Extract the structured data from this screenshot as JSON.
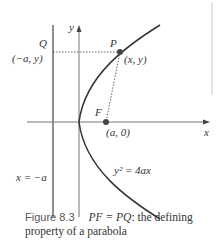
{
  "diagram": {
    "type": "parabola-focus-directrix",
    "labels": {
      "y_axis": "y",
      "x_axis": "x",
      "point_Q": "Q",
      "point_Q_coords": "(−a, y)",
      "point_P": "P",
      "point_P_coords": "(x, y)",
      "point_F": "F",
      "point_F_coords": "(a, 0)",
      "directrix": "x = −a",
      "equation": "y² = 4ax"
    },
    "colors": {
      "curve": "#333333",
      "axes": "#555555",
      "dotted": "#555555",
      "point": "#444444",
      "text": "#333333"
    }
  },
  "caption": {
    "figure_number": "Figure 8.3",
    "equation": "PF = PQ",
    "text_rest": ": the defining",
    "line2": "property of a parabola"
  }
}
